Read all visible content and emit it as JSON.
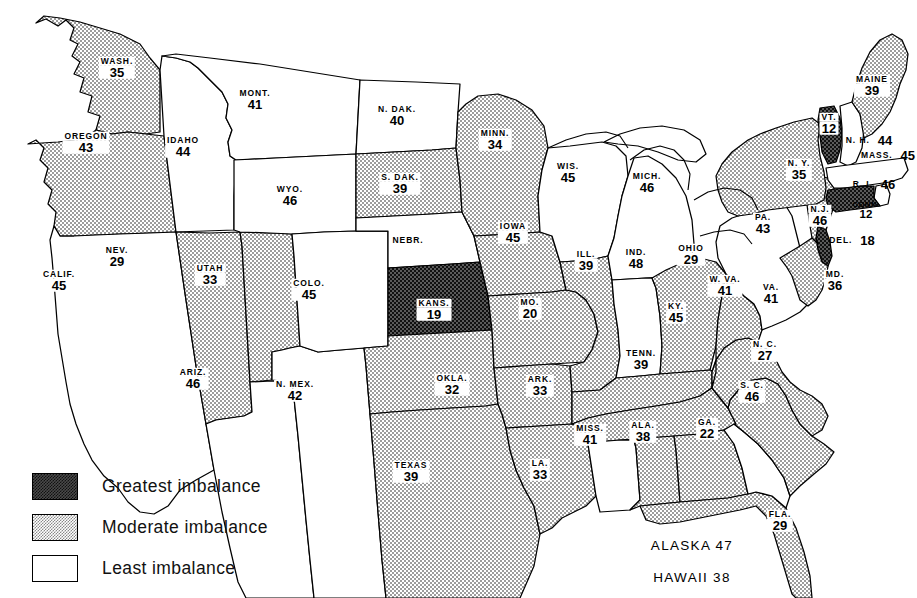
{
  "map": {
    "title": "United States imbalance map",
    "legend": {
      "items": [
        {
          "key": "greatest",
          "label": "Greatest imbalance",
          "swatch": "dark-checker-swatch",
          "color": "#3c3c3c"
        },
        {
          "key": "moderate",
          "label": "Moderate imbalance",
          "swatch": "light-dot-swatch",
          "color": "#b8b8b8"
        },
        {
          "key": "least",
          "label": "Least imbalance",
          "swatch": "white-swatch",
          "color": "#ffffff"
        }
      ]
    },
    "states": [
      {
        "code": "WASH",
        "name": "WASH.",
        "value": "35",
        "level": "moderate",
        "x": 117,
        "y": 68
      },
      {
        "code": "OREG",
        "name": "OREGON",
        "value": "43",
        "level": "moderate",
        "x": 86,
        "y": 143
      },
      {
        "code": "CALIF",
        "name": "CALIF.",
        "value": "45",
        "level": "least",
        "x": 59,
        "y": 281
      },
      {
        "code": "NEV",
        "name": "NEV.",
        "value": "29",
        "level": "moderate",
        "x": 117,
        "y": 257
      },
      {
        "code": "IDAHO",
        "name": "IDAHO",
        "value": "44",
        "level": "least",
        "x": 183,
        "y": 147
      },
      {
        "code": "UTAH",
        "name": "UTAH",
        "value": "33",
        "level": "moderate",
        "x": 210,
        "y": 275
      },
      {
        "code": "ARIZ",
        "name": "ARIZ.",
        "value": "46",
        "level": "least",
        "x": 193,
        "y": 379
      },
      {
        "code": "MONT",
        "name": "MONT.",
        "value": "41",
        "level": "least",
        "x": 255,
        "y": 100
      },
      {
        "code": "WYO",
        "name": "WYO.",
        "value": "46",
        "level": "least",
        "x": 290,
        "y": 196
      },
      {
        "code": "COLO",
        "name": "COLO.",
        "value": "45",
        "level": "least",
        "x": 309,
        "y": 290
      },
      {
        "code": "NMEX",
        "name": "N. MEX.",
        "value": "42",
        "level": "least",
        "x": 295,
        "y": 391
      },
      {
        "code": "NDAK",
        "name": "N. DAK.",
        "value": "40",
        "level": "least",
        "x": 397,
        "y": 116
      },
      {
        "code": "SDAK",
        "name": "S. DAK.",
        "value": "39",
        "level": "moderate",
        "x": 400,
        "y": 184
      },
      {
        "code": "NEBR",
        "name": "NEBR.",
        "value": "",
        "level": "least",
        "x": 408,
        "y": 240
      },
      {
        "code": "KANS",
        "name": "KANS.",
        "value": "19",
        "level": "greatest",
        "x": 434,
        "y": 310
      },
      {
        "code": "OKLA",
        "name": "OKLA.",
        "value": "32",
        "level": "moderate",
        "x": 452,
        "y": 385
      },
      {
        "code": "TEXAS",
        "name": "TEXAS",
        "value": "39",
        "level": "moderate",
        "x": 411,
        "y": 472
      },
      {
        "code": "MINN",
        "name": "MINN.",
        "value": "34",
        "level": "moderate",
        "x": 495,
        "y": 140
      },
      {
        "code": "IOWA",
        "name": "IOWA",
        "value": "45",
        "level": "moderate",
        "x": 513,
        "y": 233
      },
      {
        "code": "MO",
        "name": "MO.",
        "value": "20",
        "level": "moderate",
        "x": 530,
        "y": 309
      },
      {
        "code": "ARK",
        "name": "ARK.",
        "value": "33",
        "level": "moderate",
        "x": 540,
        "y": 386
      },
      {
        "code": "LA",
        "name": "LA.",
        "value": "33",
        "level": "moderate",
        "x": 540,
        "y": 470
      },
      {
        "code": "WIS",
        "name": "WIS.",
        "value": "45",
        "level": "least",
        "x": 568,
        "y": 173
      },
      {
        "code": "ILL",
        "name": "ILL.",
        "value": "39",
        "level": "moderate",
        "x": 586,
        "y": 261
      },
      {
        "code": "MISS",
        "name": "MISS.",
        "value": "41",
        "level": "least",
        "x": 590,
        "y": 435
      },
      {
        "code": "MICH",
        "name": "MICH.",
        "value": "46",
        "level": "least",
        "x": 647,
        "y": 183
      },
      {
        "code": "IND",
        "name": "IND.",
        "value": "48",
        "level": "least",
        "x": 636,
        "y": 259
      },
      {
        "code": "ALA",
        "name": "ALA.",
        "value": "38",
        "level": "moderate",
        "x": 643,
        "y": 432
      },
      {
        "code": "KY",
        "name": "KY.",
        "value": "45",
        "level": "moderate",
        "x": 676,
        "y": 313
      },
      {
        "code": "OHIO",
        "name": "OHIO",
        "value": "29",
        "level": "moderate",
        "x": 691,
        "y": 255
      },
      {
        "code": "TENN",
        "name": "TENN.",
        "value": "39",
        "level": "moderate",
        "x": 641,
        "y": 360
      },
      {
        "code": "GA",
        "name": "GA.",
        "value": "22",
        "level": "moderate",
        "x": 707,
        "y": 429
      },
      {
        "code": "WVA",
        "name": "W. VA.",
        "value": "41",
        "level": "moderate",
        "x": 725,
        "y": 286
      },
      {
        "code": "FLA",
        "name": "FLA.",
        "value": "29",
        "level": "moderate",
        "x": 780,
        "y": 521
      },
      {
        "code": "SC",
        "name": "S. C.",
        "value": "46",
        "level": "least",
        "x": 752,
        "y": 392
      },
      {
        "code": "NC",
        "name": "N. C.",
        "value": "27",
        "level": "moderate",
        "x": 765,
        "y": 351
      },
      {
        "code": "VA",
        "name": "VA.",
        "value": "41",
        "level": "moderate",
        "x": 771,
        "y": 294
      },
      {
        "code": "PA",
        "name": "PA.",
        "value": "43",
        "level": "least",
        "x": 763,
        "y": 224
      },
      {
        "code": "MD",
        "name": "MD.",
        "value": "36",
        "level": "moderate",
        "x": 835,
        "y": 281
      },
      {
        "code": "NJ",
        "name": "N.J.",
        "value": "46",
        "level": "moderate",
        "x": 820,
        "y": 216
      },
      {
        "code": "NY",
        "name": "N. Y.",
        "value": "35",
        "level": "moderate",
        "x": 799,
        "y": 170
      },
      {
        "code": "VT",
        "name": "VT.",
        "value": "12",
        "level": "greatest",
        "x": 829,
        "y": 124
      },
      {
        "code": "MAINE",
        "name": "MAINE",
        "value": "39",
        "level": "moderate",
        "x": 872,
        "y": 86
      }
    ],
    "inline_states": [
      {
        "code": "NH",
        "name": "N. H.",
        "value": "44",
        "x": 869,
        "y": 140
      },
      {
        "code": "MASS",
        "name": "MASS.",
        "value": "45",
        "x": 888,
        "y": 155
      },
      {
        "code": "RI",
        "name": "R. I.",
        "value": "46",
        "x": 874,
        "y": 184
      },
      {
        "code": "DEL",
        "name": "DEL.",
        "value": "18",
        "x": 852,
        "y": 240
      }
    ],
    "stacked_small": [
      {
        "code": "CONN",
        "name": "CONN.",
        "value": "12",
        "x": 866,
        "y": 211
      }
    ],
    "offshore": [
      {
        "code": "ALASKA",
        "name": "ALASKA",
        "value": "47",
        "x": 692,
        "y": 545
      },
      {
        "code": "HAWAII",
        "name": "HAWAII",
        "value": "38",
        "x": 692,
        "y": 577
      }
    ]
  }
}
